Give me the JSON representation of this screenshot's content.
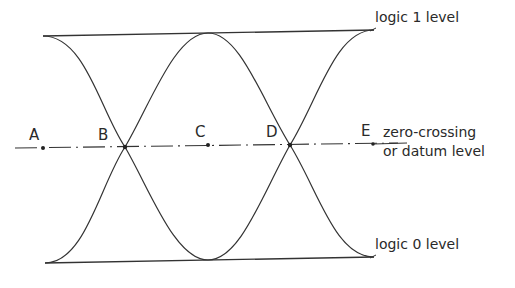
{
  "diagram": {
    "levels": {
      "logic1": "logic 1 level",
      "logic0": "logic 0 level",
      "datum_line1": "zero-crossing",
      "datum_line2": "or datum level"
    },
    "points": [
      {
        "id": "A",
        "label": "A"
      },
      {
        "id": "B",
        "label": "B"
      },
      {
        "id": "C",
        "label": "C"
      },
      {
        "id": "D",
        "label": "D"
      },
      {
        "id": "E",
        "label": "E"
      }
    ],
    "colors": {
      "ink": "#2a2a2a",
      "background": "#ffffff"
    }
  }
}
